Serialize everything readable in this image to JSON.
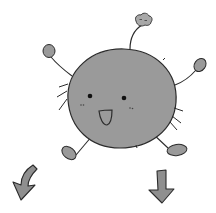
{
  "illustration": {
    "subject": "Round gray fuzzy creature jumping with arms raised",
    "colors": {
      "body_fill": "#9a9a9a",
      "outline": "#2b2b2b",
      "background": "#ffffff",
      "mouth_fill": "#9a9a9a",
      "cloud_fill": "#a8a8a8",
      "arrow_fill": "#8f8f8f"
    },
    "elements": {
      "body": "round-body",
      "face": [
        "left-eye",
        "right-eye",
        "left-cheek",
        "right-cheek",
        "open-mouth"
      ],
      "antenna_top": "small-cloud",
      "limbs": [
        "left-arm",
        "right-arm",
        "left-leg",
        "right-leg"
      ],
      "arrows": [
        "curved-down-left-arrow",
        "straight-down-arrow"
      ]
    }
  }
}
